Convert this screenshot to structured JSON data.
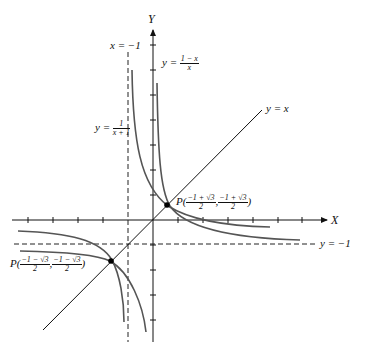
{
  "diagram": {
    "axes": {
      "x_label": "X",
      "y_label": "Y"
    },
    "asymptotes": {
      "vertical": {
        "label": "x = −1"
      },
      "horizontal": {
        "label": "y = −1"
      }
    },
    "curves": [
      {
        "name": "y = 1/(x+1)",
        "label_lhs": "y =",
        "num": "1",
        "den": "x + 1"
      },
      {
        "name": "y = (1-x)/x",
        "label_lhs": "y =",
        "num": "1 − x",
        "den": "x"
      }
    ],
    "line": {
      "label": "y = x"
    },
    "points": [
      {
        "label": "P",
        "open": "(",
        "x_num": "−1 + √3",
        "x_den": "2",
        "sep": ",",
        "y_num": "−1 + √3",
        "y_den": "2",
        "close": ")"
      },
      {
        "label": "P",
        "open": "(",
        "x_num": "−1 − √3",
        "x_den": "2",
        "sep": ",",
        "y_num": "−1 − √3",
        "y_den": "2",
        "close": ")"
      }
    ],
    "colors": {
      "curve": "#555555",
      "axis": "#111111",
      "dashed": "#222222"
    }
  }
}
